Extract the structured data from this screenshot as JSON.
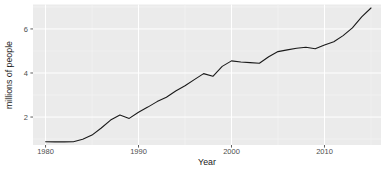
{
  "chart_data": {
    "type": "line",
    "title": "",
    "xlabel": "Year",
    "ylabel": "millions of people",
    "x": [
      1980,
      1981,
      1982,
      1983,
      1984,
      1985,
      1986,
      1987,
      1988,
      1989,
      1990,
      1991,
      1992,
      1993,
      1994,
      1995,
      1996,
      1997,
      1998,
      1999,
      2000,
      2001,
      2002,
      2003,
      2004,
      2005,
      2006,
      2007,
      2008,
      2009,
      2010,
      2011,
      2012,
      2013,
      2014,
      2015
    ],
    "values": [
      0.88,
      0.87,
      0.87,
      0.88,
      0.99,
      1.18,
      1.5,
      1.86,
      2.09,
      1.94,
      2.22,
      2.45,
      2.7,
      2.9,
      3.18,
      3.42,
      3.7,
      3.97,
      3.85,
      4.3,
      4.55,
      4.5,
      4.47,
      4.44,
      4.74,
      4.97,
      5.05,
      5.12,
      5.17,
      5.1,
      5.27,
      5.42,
      5.7,
      6.05,
      6.55,
      6.95
    ],
    "x_ticks": [
      1980,
      1990,
      2000,
      2010
    ],
    "x_tick_labels": [
      "1980",
      "1990",
      "2000",
      "2010"
    ],
    "y_ticks": [
      2,
      4,
      6
    ],
    "y_tick_labels": [
      "2",
      "4",
      "6"
    ],
    "x_minor_ticks": [
      1985,
      1995,
      2005,
      2015
    ],
    "y_minor_ticks": [
      1,
      3,
      5,
      7
    ],
    "xlim": [
      1978.65,
      2016.08
    ],
    "ylim": [
      0.73,
      7.11
    ],
    "grid": "on",
    "legend_position": "none",
    "style": "ggplot-gray-panel",
    "colors": {
      "page_bg": "#ffffff",
      "panel_bg": "#ebebeb",
      "grid_major": "#ffffff",
      "grid_minor": "#f5f5f5",
      "line": "#1a1a1a",
      "tick_mark": "#333333",
      "tick_label": "#4d4d4d",
      "axis_title": "#1a1a1a"
    }
  }
}
